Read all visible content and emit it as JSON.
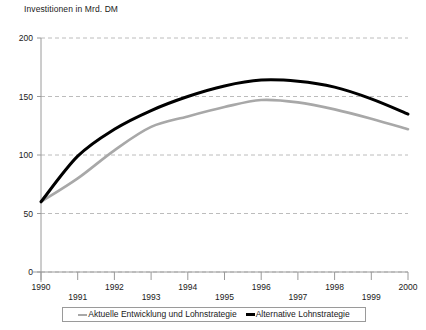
{
  "chart_data": {
    "type": "line",
    "title": "Investitionen in Mrd. DM",
    "xlabel": "",
    "ylabel": "Investitionen in Mrd. DM",
    "x": [
      1990,
      1991,
      1992,
      1993,
      1994,
      1995,
      1996,
      1997,
      1998,
      1999,
      2000
    ],
    "categories": [
      "1990",
      "1991",
      "1992",
      "1993",
      "1994",
      "1995",
      "1996",
      "1997",
      "1998",
      "1999",
      "2000"
    ],
    "xlim": [
      1990,
      2000
    ],
    "ylim": [
      0,
      200
    ],
    "yticks": [
      0,
      50,
      100,
      150,
      200
    ],
    "ytick_labels": [
      "0",
      "50",
      "100",
      "150",
      "200"
    ],
    "xticks": [
      1990,
      1991,
      1992,
      1993,
      1994,
      1995,
      1996,
      1997,
      1998,
      1999,
      2000
    ],
    "xtick_labels": [
      "1990",
      "1991",
      "1992",
      "1993",
      "1994",
      "1995",
      "1996",
      "1997",
      "1998",
      "1999",
      "2000"
    ],
    "grid": "horizontal-dashed",
    "legend_position": "bottom-center",
    "series": [
      {
        "name": "Aktuelle Entwicklung und Lohnstrategie",
        "color": "#a8a8a8",
        "width": 2.6,
        "values": [
          60,
          80,
          104,
          124,
          133,
          141,
          147,
          145,
          139,
          131,
          122
        ]
      },
      {
        "name": "Alternative Lohnstrategie",
        "color": "#000000",
        "width": 3.0,
        "values": [
          60,
          99,
          122,
          138,
          150,
          159,
          164,
          163,
          158,
          148,
          135
        ]
      }
    ]
  },
  "axis": {
    "y_title": "Investitionen in Mrd. DM"
  },
  "legend": {
    "entries": [
      {
        "label": "Aktuelle Entwicklung und Lohnstrategie",
        "color": "#a8a8a8"
      },
      {
        "label": "Alternative Lohnstrategie",
        "color": "#000000"
      }
    ]
  },
  "colors": {
    "grid": "#bcbcbc",
    "axis": "#9a9a9a",
    "series_actual": "#a8a8a8",
    "series_alternative": "#000000",
    "text": "#1a1a1a"
  }
}
